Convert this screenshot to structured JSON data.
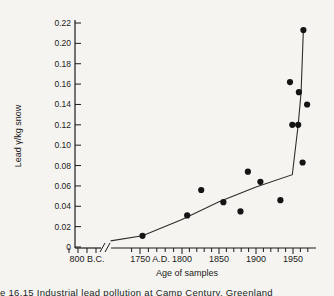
{
  "page": {
    "running_header": "Tsaihwa J. Chow and Clair C. Patterson",
    "caption": "e 16.15  Industrial lead pollution at Camp Century, Greenland"
  },
  "colors": {
    "paper": "#f6f4f0",
    "ink": "#1b1b1b",
    "line": "#2e2d2b"
  },
  "chart_data": {
    "type": "scatter",
    "title": "",
    "xlabel": "Age of samples",
    "ylabel": "Lead γ/kg snow",
    "x_axis": {
      "pre_break_label": "800 B.C.",
      "has_axis_break": true,
      "year_labels": [
        {
          "year": 1750,
          "label": "1750 A.D."
        },
        {
          "year": 1800,
          "label": "1800"
        },
        {
          "year": 1850,
          "label": "1850"
        },
        {
          "year": 1900,
          "label": "1900"
        },
        {
          "year": 1950,
          "label": "1950"
        }
      ],
      "minor_tick_interval_years": 10,
      "minor_tick_range": [
        1740,
        1970
      ]
    },
    "y_axis": {
      "min": 0,
      "max": 0.22,
      "tick_interval": 0.02,
      "tick_labels": [
        "0",
        "0.02",
        "0.04",
        "0.06",
        "0.08",
        "0.10",
        "0.12",
        "0.14",
        "0.16",
        "0.18",
        "0.20",
        "0.22"
      ]
    },
    "points": [
      {
        "year": 1753,
        "value": 0.011
      },
      {
        "year": 1807,
        "value": 0.031
      },
      {
        "year": 1826,
        "value": 0.056
      },
      {
        "year": 1856,
        "value": 0.044
      },
      {
        "year": 1879,
        "value": 0.035
      },
      {
        "year": 1889,
        "value": 0.074
      },
      {
        "year": 1906,
        "value": 0.064
      },
      {
        "year": 1933,
        "value": 0.046
      },
      {
        "year": 1946,
        "value": 0.162
      },
      {
        "year": 1949,
        "value": 0.12
      },
      {
        "year": 1957,
        "value": 0.12
      },
      {
        "year": 1958,
        "value": 0.152
      },
      {
        "year": 1963,
        "value": 0.083
      },
      {
        "year": 1964,
        "value": 0.213
      },
      {
        "year": 1969,
        "value": 0.14
      }
    ],
    "trend_line": [
      {
        "year": 1715,
        "value": 0.006
      },
      {
        "year": 1753,
        "value": 0.011
      },
      {
        "year": 1800,
        "value": 0.027
      },
      {
        "year": 1850,
        "value": 0.0445
      },
      {
        "year": 1900,
        "value": 0.059
      },
      {
        "year": 1949,
        "value": 0.071
      },
      {
        "year": 1957,
        "value": 0.12
      },
      {
        "year": 1961,
        "value": 0.152
      },
      {
        "year": 1964,
        "value": 0.214
      }
    ]
  }
}
